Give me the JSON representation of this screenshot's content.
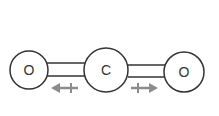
{
  "molecule": {
    "atoms": [
      {
        "label": "O"
      },
      {
        "label": "C"
      },
      {
        "label": "O"
      }
    ],
    "bonds": [
      "double",
      "double"
    ],
    "arrows": [
      {
        "direction": "left",
        "symbol": "dipole-arrow"
      },
      {
        "direction": "right",
        "symbol": "dipole-arrow"
      }
    ],
    "colors": {
      "stroke": "#333333",
      "arrow": "#8c8c8c"
    }
  }
}
